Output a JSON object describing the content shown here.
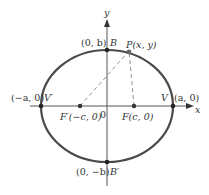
{
  "diagram": {
    "type": "ellipse",
    "colors": {
      "ellipse": "#4a4a4a",
      "axis": "#555555",
      "dashed": "#888888",
      "point": "#222222",
      "text": "#333333"
    },
    "axes": {
      "x_label": "x",
      "y_label": "y",
      "origin_label": "0"
    },
    "points": {
      "B": {
        "coord": "(0, b)",
        "name": "B"
      },
      "B_prime": {
        "coord": "(0, −b)",
        "name": "B′"
      },
      "V": {
        "coord": "(a, 0)",
        "name": "V"
      },
      "V_prime": {
        "coord": "(−a, 0)",
        "name": "V′"
      },
      "F": {
        "label": "F(c, 0)"
      },
      "F_prime": {
        "label": "F′(−c, 0)"
      },
      "P": {
        "label": "P(x, y)"
      }
    }
  }
}
